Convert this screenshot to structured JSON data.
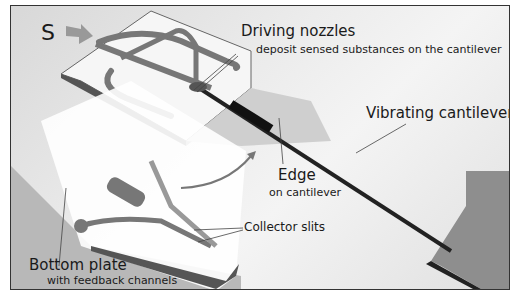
{
  "labels": {
    "s_marker": "S",
    "driving_nozzles_title": "Driving nozzles",
    "driving_nozzles_sub": "deposit sensed substances on the cantilever",
    "vibrating_cantilever": "Vibrating cantilever",
    "edge_title": "Edge",
    "edge_sub": "on cantilever",
    "collector_slits": "Collector slits",
    "bottom_plate_title": "Bottom plate",
    "bottom_plate_sub": "with feedback channels"
  }
}
